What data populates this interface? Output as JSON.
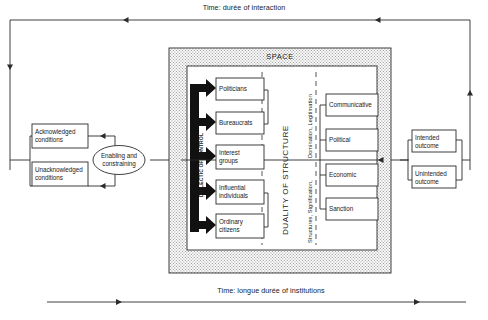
{
  "figure": {
    "top_timeline": {
      "label": "Time: durée of interaction",
      "direction": "leftward"
    },
    "bottom_timeline": {
      "label": "Time: longue durée of institutions",
      "direction": "rightward"
    },
    "space": {
      "label": "SPACE"
    },
    "conditions": [
      {
        "id": "acknowledged",
        "label": "Acknowledged\nconditions"
      },
      {
        "id": "unacknowledged",
        "label": "Unacknowledged\nconditions"
      }
    ],
    "mediator": {
      "id": "enabling-constraining",
      "label": "Enabling and\nconstraining"
    },
    "dialectic_axis": {
      "label": "DIALECTIC OF CONTROL"
    },
    "agents": [
      {
        "id": "politicians",
        "label": "Politicians"
      },
      {
        "id": "bureaucrats",
        "label": "Bureaucrats"
      },
      {
        "id": "interest-groups",
        "label": "Interest\ngroups"
      },
      {
        "id": "influential-individuals",
        "label": "Influential\nindividuals"
      },
      {
        "id": "ordinary-citizens",
        "label": "Ordinary\ncitizens"
      }
    ],
    "duality_axis": {
      "label": "DUALITY OF STRUCTURE"
    },
    "modalities_axis": {
      "label_upper": "Domination, Legitimation",
      "label_lower": "Structures, Signification,"
    },
    "structures": [
      {
        "id": "communicative",
        "label": "Communicative"
      },
      {
        "id": "political",
        "label": "Political"
      },
      {
        "id": "economic",
        "label": "Economic"
      },
      {
        "id": "sanction",
        "label": "Sanction"
      }
    ],
    "outcomes": [
      {
        "id": "intended",
        "label": "Intended\noutcome"
      },
      {
        "id": "unintended",
        "label": "Unintended\noutcome"
      }
    ],
    "colors": {
      "line": "#2b2b2b",
      "fill": "#ffffff",
      "space_fill": "#e9e9e9",
      "thick_arrow": "#111111",
      "text": "#1a1a1a"
    }
  }
}
